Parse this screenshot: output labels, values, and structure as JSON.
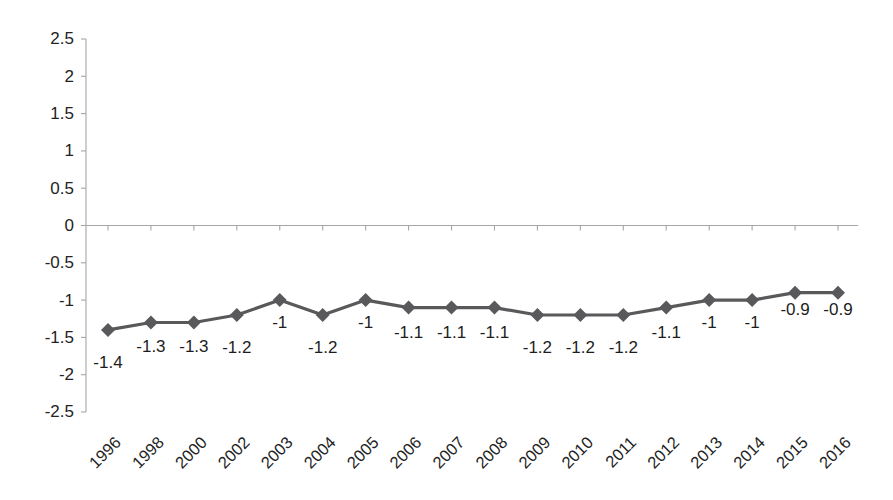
{
  "chart_data": {
    "type": "line",
    "title": "",
    "subtitle": "",
    "xlabel": "",
    "ylabel": "",
    "categories": [
      "1996",
      "1998",
      "2000",
      "2002",
      "2003",
      "2004",
      "2005",
      "2006",
      "2007",
      "2008",
      "2009",
      "2010",
      "2011",
      "2012",
      "2013",
      "2014",
      "2015",
      "2016"
    ],
    "values": [
      -1.4,
      -1.3,
      -1.3,
      -1.2,
      -1,
      -1.2,
      -1,
      -1.1,
      -1.1,
      -1.1,
      -1.2,
      -1.2,
      -1.2,
      -1.1,
      -1,
      -1,
      -0.9,
      -0.9
    ],
    "point_labels": [
      "-1.4",
      "-1.3",
      "-1.3",
      "-1.2",
      "-1",
      "-1.2",
      "-1",
      "-1.1",
      "-1.1",
      "-1.1",
      "-1.2",
      "-1.2",
      "-1.2",
      "-1.1",
      "-1",
      "-1",
      "-0.9",
      "-0.9"
    ],
    "ylim": [
      -2.5,
      2.5
    ],
    "ytick_values": [
      2.5,
      2,
      1.5,
      1,
      0.5,
      0,
      -0.5,
      -1,
      -1.5,
      -2,
      -2.5
    ],
    "ytick_labels": [
      "2.5",
      "2",
      "1.5",
      "1",
      "0.5",
      "0",
      "-0.5",
      "-1",
      "-1.5",
      "-2",
      "-2.5"
    ],
    "grid": false,
    "legend": false,
    "legend_position": "none",
    "series": [
      {
        "name": "",
        "values": [
          -1.4,
          -1.3,
          -1.3,
          -1.2,
          -1,
          -1.2,
          -1,
          -1.1,
          -1.1,
          -1.1,
          -1.2,
          -1.2,
          -1.2,
          -1.1,
          -1,
          -1,
          -0.9,
          -0.9
        ],
        "color": "#59595b",
        "marker": "diamond"
      }
    ],
    "xtick_rotation": -45,
    "zero_line": true
  },
  "style": {
    "series_color": "#59595b",
    "axis_color": "#a6a6a6",
    "text_color": "#232323",
    "background": "#ffffff"
  },
  "axis": {
    "y_axis_name": "value-axis",
    "x_axis_name": "category-axis"
  }
}
